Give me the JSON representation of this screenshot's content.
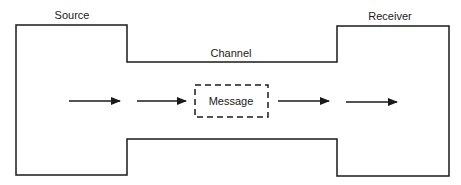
{
  "diagram": {
    "title": "",
    "labels": {
      "source": "Source",
      "receiver": "Receiver",
      "channel": "Channel",
      "message": "Message"
    },
    "colors": {
      "stroke": "#1a1a1a",
      "background": "#ffffff"
    },
    "arrows": [
      {
        "from": "source",
        "to": "message",
        "count": 2
      },
      {
        "from": "message",
        "to": "receiver",
        "count": 2
      }
    ]
  }
}
